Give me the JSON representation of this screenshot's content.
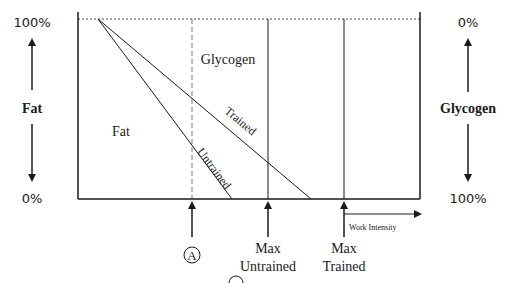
{
  "diagram": {
    "type": "fuel-utilization-vs-work-intensity",
    "left_axis": {
      "top_label": "100%",
      "bottom_label": "0%",
      "title": "Fat"
    },
    "right_axis": {
      "top_label": "0%",
      "bottom_label": "100%",
      "title": "Glycogen"
    },
    "regions": {
      "upper": "Glycogen",
      "lower": "Fat"
    },
    "lines": [
      {
        "name": "Untrained",
        "label": "Untrained"
      },
      {
        "name": "Trained",
        "label": "Trained"
      }
    ],
    "markers": [
      {
        "id": "A",
        "label": "A",
        "style": "dashed",
        "circled": true
      },
      {
        "id": "max-untrained",
        "line1": "Max",
        "line2": "Untrained",
        "style": "solid"
      },
      {
        "id": "max-trained",
        "line1": "Max",
        "line2": "Trained",
        "style": "solid"
      }
    ],
    "x_axis": {
      "label": "Work Intensity"
    },
    "colors": {
      "line": "#1a1a1a",
      "background": "#ffffff"
    }
  }
}
